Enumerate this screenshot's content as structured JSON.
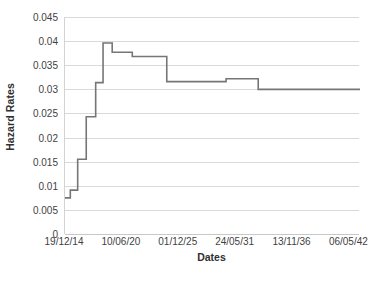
{
  "chart_data": {
    "type": "line",
    "subtype": "step",
    "title": "",
    "xlabel": "Dates",
    "ylabel": "Hazard Rates",
    "ylim": [
      0,
      0.045
    ],
    "ytick_labels": [
      "0.045",
      "0.04",
      "0.035",
      "0.03",
      "0.025",
      "0.02",
      "0.015",
      "0.01",
      "0.005",
      "0"
    ],
    "ytick_values": [
      0.045,
      0.04,
      0.035,
      0.03,
      0.025,
      0.02,
      0.015,
      0.01,
      0.005,
      0
    ],
    "xtick_labels": [
      "19/12/14",
      "10/06/20",
      "01/12/25",
      "24/05/31",
      "13/11/36",
      "06/05/42"
    ],
    "xtick_fractions": [
      0.0,
      0.1928,
      0.3856,
      0.5784,
      0.7712,
      0.964
    ],
    "grid": true,
    "legend": false,
    "series": [
      {
        "name": "Hazard Rate",
        "color": "#767676",
        "line_width": 1.6,
        "step_points": [
          {
            "x": 0.0,
            "y": 0.0075
          },
          {
            "x": 0.018,
            "y": 0.0075
          },
          {
            "x": 0.018,
            "y": 0.0091
          },
          {
            "x": 0.043,
            "y": 0.0091
          },
          {
            "x": 0.043,
            "y": 0.0155
          },
          {
            "x": 0.072,
            "y": 0.0155
          },
          {
            "x": 0.072,
            "y": 0.0243
          },
          {
            "x": 0.104,
            "y": 0.0243
          },
          {
            "x": 0.104,
            "y": 0.0314
          },
          {
            "x": 0.129,
            "y": 0.0314
          },
          {
            "x": 0.129,
            "y": 0.0396
          },
          {
            "x": 0.16,
            "y": 0.0396
          },
          {
            "x": 0.16,
            "y": 0.0377
          },
          {
            "x": 0.228,
            "y": 0.0377
          },
          {
            "x": 0.228,
            "y": 0.0368
          },
          {
            "x": 0.345,
            "y": 0.0368
          },
          {
            "x": 0.345,
            "y": 0.0316
          },
          {
            "x": 0.546,
            "y": 0.0316
          },
          {
            "x": 0.546,
            "y": 0.0322
          },
          {
            "x": 0.655,
            "y": 0.0322
          },
          {
            "x": 0.655,
            "y": 0.03
          },
          {
            "x": 1.0,
            "y": 0.03
          }
        ]
      }
    ]
  }
}
